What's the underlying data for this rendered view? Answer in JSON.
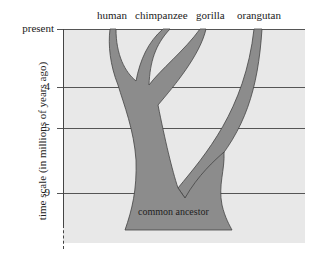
{
  "diagram": {
    "species": [
      "human",
      "chimpanzee",
      "gorilla",
      "orangutan"
    ],
    "y_axis_label": "time scale (in millions of years ago)",
    "ticks": [
      "present",
      "4",
      "5",
      "9"
    ],
    "root_label": "common ancestor",
    "colors": {
      "panel": "#e8e8e8",
      "tree": "#8c8c8c",
      "outline": "#444444"
    }
  }
}
